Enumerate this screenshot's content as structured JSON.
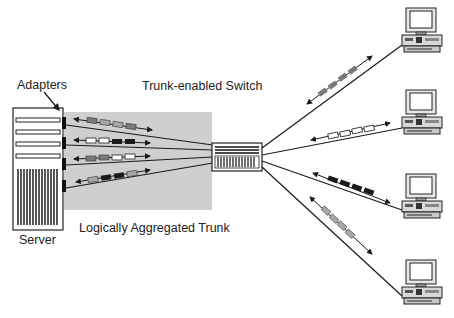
{
  "labels": {
    "adapters": "Adapters",
    "switch": "Trunk-enabled Switch",
    "server": "Server",
    "trunk": "Logically Aggregated Trunk"
  },
  "colors": {
    "trunk_bg": "#cfcfcf",
    "line": "#1a1a1a",
    "packet_gray": "#7a7a7a",
    "packet_light": "#a8a8a8",
    "packet_black": "#1a1a1a",
    "packet_white": "#ffffff"
  },
  "trunk_links": [
    {
      "packets": [
        "gray",
        "light",
        "light",
        "gray"
      ]
    },
    {
      "packets": [
        "white",
        "white",
        "black",
        "black"
      ]
    },
    {
      "packets": [
        "gray",
        "gray",
        "white",
        "white"
      ]
    },
    {
      "packets": [
        "light",
        "black",
        "black",
        "light"
      ]
    }
  ],
  "client_links": [
    {
      "packets": [
        "gray",
        "gray",
        "gray",
        "gray"
      ]
    },
    {
      "packets": [
        "white",
        "white",
        "white",
        "white"
      ]
    },
    {
      "packets": [
        "black",
        "black",
        "black",
        "black"
      ]
    },
    {
      "packets": [
        "light",
        "light",
        "light",
        "light"
      ]
    }
  ],
  "clients": [
    "workstation-1",
    "workstation-2",
    "workstation-3",
    "workstation-4"
  ]
}
